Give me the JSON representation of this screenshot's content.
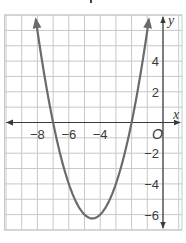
{
  "chart_data": {
    "type": "line",
    "title": "",
    "xlabel": "x",
    "ylabel": "y",
    "origin_label": "O",
    "xlim": [
      -10,
      1
    ],
    "ylim": [
      -7,
      7
    ],
    "grid": true,
    "grid_step": 1,
    "x_ticks": [
      {
        "value": -8,
        "label": "−8"
      },
      {
        "value": -6,
        "label": "−6"
      },
      {
        "value": -4,
        "label": "−4"
      }
    ],
    "y_ticks": [
      {
        "value": 4,
        "label": "4"
      },
      {
        "value": 2,
        "label": "2"
      },
      {
        "value": -2,
        "label": "−2"
      },
      {
        "value": -4,
        "label": "−4"
      },
      {
        "value": -6,
        "label": "−6"
      }
    ],
    "series": [
      {
        "name": "parabola",
        "equation": "y = x^2 + 9x + 14",
        "vertex": [
          -4.5,
          -6.25
        ],
        "x_intercepts": [
          -7,
          -2
        ],
        "x": [
          -8.1,
          -8,
          -7,
          -6,
          -5,
          -4.5,
          -4,
          -3,
          -2,
          -1,
          -0.9
        ],
        "values": [
          6.71,
          6,
          0,
          -4,
          -6,
          -6.25,
          -6,
          -4,
          0,
          6,
          6.71
        ],
        "color": "#6b6b6b",
        "arrows_at_ends": true
      }
    ]
  },
  "colors": {
    "grid": "#c8c8c8",
    "axis": "#3a3a3a",
    "curve": "#6b6b6b"
  }
}
